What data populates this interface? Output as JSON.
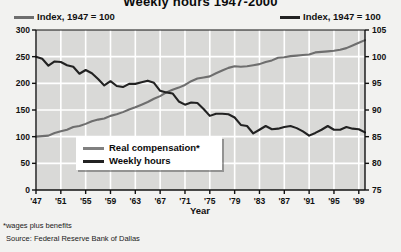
{
  "title": "Weekly hours 1947-2000",
  "legend_top": [
    {
      "label": "Index, 1947 = 100",
      "color": "#6e6e6e"
    },
    {
      "label": "Index, 1947 = 100",
      "color": "#222222"
    }
  ],
  "inner_legend": [
    {
      "label": "Real compensation*",
      "color": "#808080"
    },
    {
      "label": "Weekly hours",
      "color": "#222222"
    }
  ],
  "footnotes": {
    "star": "*wages plus benefits",
    "source": "Source: Federal Reserve Bank of Dallas"
  },
  "colors": {
    "real_compensation": "#6e6e6e",
    "weekly_hours": "#222222",
    "plot_background": "#d9d9d7",
    "gridline": "#ffffff",
    "axis": "#111111",
    "page_background": "#f2f2f0"
  },
  "chart_data": {
    "type": "line",
    "title": "Weekly hours 1947-2000",
    "xlabel": "Year",
    "ylabel": "",
    "grid": true,
    "legend_position": "inside-lower-left",
    "x": [
      1947,
      1948,
      1949,
      1950,
      1951,
      1952,
      1953,
      1954,
      1955,
      1956,
      1957,
      1958,
      1959,
      1960,
      1961,
      1962,
      1963,
      1964,
      1965,
      1966,
      1967,
      1968,
      1969,
      1970,
      1971,
      1972,
      1973,
      1974,
      1975,
      1976,
      1977,
      1978,
      1979,
      1980,
      1981,
      1982,
      1983,
      1984,
      1985,
      1986,
      1987,
      1988,
      1989,
      1990,
      1991,
      1992,
      1993,
      1994,
      1995,
      1996,
      1997,
      1998,
      1999,
      2000
    ],
    "xtick_labels": [
      "'47",
      "'51",
      "'55",
      "'59",
      "'63",
      "'67",
      "'71",
      "'75",
      "'79",
      "'83",
      "'87",
      "'91",
      "'95",
      "'99"
    ],
    "xtick_values": [
      1947,
      1951,
      1955,
      1959,
      1963,
      1967,
      1971,
      1975,
      1979,
      1983,
      1987,
      1991,
      1995,
      1999
    ],
    "axes": [
      {
        "id": "left",
        "label": "Index, 1947 = 100",
        "series": "Real compensation*",
        "ylim": [
          0,
          300
        ],
        "yticks": [
          0,
          50,
          100,
          150,
          200,
          250,
          300
        ]
      },
      {
        "id": "right",
        "label": "Index, 1947 = 100",
        "series": "Weekly hours",
        "ylim": [
          75,
          105
        ],
        "yticks": [
          75,
          80,
          85,
          90,
          95,
          100,
          105
        ]
      }
    ],
    "series": [
      {
        "name": "Real compensation*",
        "axis": "left",
        "color": "#6e6e6e",
        "unit": "Index, 1947 = 100",
        "values": [
          100,
          101,
          102,
          107,
          110,
          113,
          118,
          120,
          124,
          129,
          132,
          134,
          139,
          142,
          146,
          151,
          155,
          160,
          165,
          171,
          176,
          183,
          188,
          192,
          197,
          204,
          209,
          211,
          213,
          219,
          224,
          229,
          232,
          231,
          232,
          234,
          236,
          240,
          243,
          248,
          249,
          251,
          252,
          253,
          254,
          258,
          259,
          260,
          261,
          263,
          266,
          271,
          276,
          281
        ]
      },
      {
        "name": "Weekly hours",
        "axis": "right",
        "color": "#222222",
        "unit": "Index, 1947 = 100",
        "values": [
          100,
          99.6,
          98.3,
          99.1,
          99.0,
          98.4,
          98.1,
          96.8,
          97.5,
          96.9,
          95.8,
          94.6,
          95.4,
          94.5,
          94.3,
          94.9,
          94.9,
          95.2,
          95.5,
          95.1,
          93.6,
          93.3,
          93.1,
          91.6,
          91.0,
          91.4,
          91.3,
          90.2,
          88.9,
          89.3,
          89.3,
          89.2,
          88.6,
          87.2,
          87.0,
          85.6,
          86.3,
          87.0,
          86.4,
          86.5,
          86.8,
          87.0,
          86.6,
          86.0,
          85.2,
          85.7,
          86.3,
          87.0,
          86.3,
          86.3,
          86.8,
          86.5,
          86.4,
          85.8
        ]
      }
    ]
  }
}
